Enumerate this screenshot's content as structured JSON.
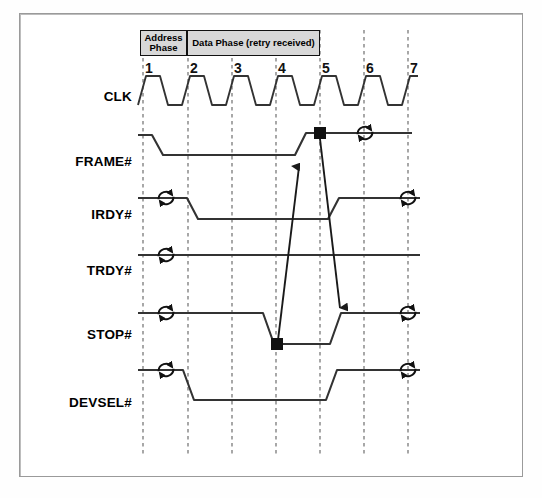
{
  "diagram": {
    "colors": {
      "waveform": "#333333",
      "gridline": "#6e6e6e",
      "phase_fill": "#d8d8d8",
      "border": "#9a9a9a",
      "marker": "#111111"
    },
    "phases": [
      {
        "label": "Address Phase",
        "name": "address-phase",
        "x": 140,
        "width": 47
      },
      {
        "label": "Data Phase (retry received)",
        "name": "data-phase",
        "x": 187,
        "width": 133
      }
    ],
    "cycles": [
      {
        "number": "1",
        "x": 143
      },
      {
        "number": "2",
        "x": 188
      },
      {
        "number": "3",
        "x": 232
      },
      {
        "number": "4",
        "x": 276
      },
      {
        "number": "5",
        "x": 320
      },
      {
        "number": "6",
        "x": 364
      },
      {
        "number": "7",
        "x": 408
      }
    ],
    "signals": [
      {
        "label": "CLK",
        "name": "signal-clk",
        "y": 98
      },
      {
        "label": "FRAME#",
        "name": "signal-frame",
        "y": 163
      },
      {
        "label": "IRDY#",
        "name": "signal-irdy",
        "y": 216
      },
      {
        "label": "TRDY#",
        "name": "signal-trdy",
        "y": 272
      },
      {
        "label": "STOP#",
        "name": "signal-stop",
        "y": 336
      },
      {
        "label": "DEVSEL#",
        "name": "signal-devsel",
        "y": 404
      }
    ],
    "waveforms": {
      "clk": "M138,105 L146,76 L160,76 L168,105 L182,105 L190,76 L204,76 L212,105 L226,105 L234,76 L248,76 L256,105 L270,105 L278,76 L292,76 L300,105 L314,105 L322,76 L336,76 L344,105 L358,105 L366,76 L380,76 L388,105 L402,105 L410,76 L418,76",
      "frame": "M138,135 L152,135 L163,155 L295,155 L306,133 L412,133",
      "irdy": "M138,198 L187,198 L198,219 L328,219 L339,198 L420,198",
      "trdy": "M138,255 L420,255",
      "stop": "M138,313 L263,313 L274,344 L330,344 L341,313 L420,313",
      "devsel": "M138,370 L183,370 L194,400 L326,400 L337,370 L420,370"
    },
    "markers": [
      {
        "name": "frame-stop-marker",
        "x": 320,
        "y": 133
      },
      {
        "name": "stop-assert-marker",
        "x": 277,
        "y": 344
      }
    ],
    "causal_arrows": [
      {
        "name": "stop-to-frame-arrow",
        "path": "M278,340 L299,167",
        "head": "up"
      },
      {
        "name": "frame-to-stop-arrow",
        "path": "M320,139 L340,308",
        "head": "down"
      }
    ],
    "turnarounds": [
      {
        "name": "turnaround-frame-right",
        "x": 365,
        "y": 133
      },
      {
        "name": "turnaround-irdy-left",
        "x": 166,
        "y": 198
      },
      {
        "name": "turnaround-irdy-right",
        "x": 408,
        "y": 198
      },
      {
        "name": "turnaround-trdy-left",
        "x": 166,
        "y": 255
      },
      {
        "name": "turnaround-stop-left",
        "x": 166,
        "y": 313
      },
      {
        "name": "turnaround-stop-right",
        "x": 408,
        "y": 313
      },
      {
        "name": "turnaround-devsel-left",
        "x": 166,
        "y": 370
      },
      {
        "name": "turnaround-devsel-right",
        "x": 408,
        "y": 370
      }
    ],
    "grid": {
      "top": 30,
      "bottom": 455
    }
  }
}
